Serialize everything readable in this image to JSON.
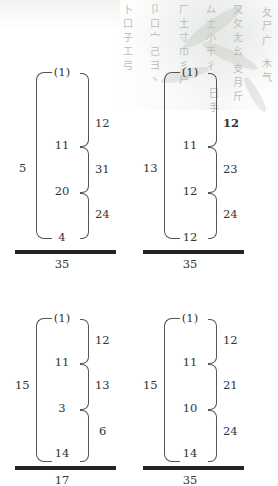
{
  "background": {
    "radical_columns": [
      [
        "卜",
        "口",
        "子",
        "工",
        "弓"
      ],
      [
        "卩",
        "口",
        "宀",
        "己",
        "彐",
        "丶"
      ],
      [
        "厂",
        "土",
        "寸",
        "巾",
        "彡",
        "户"
      ],
      [
        "厶",
        "士",
        "小",
        "干",
        "彳"
      ],
      [
        "又",
        "攵",
        "尢",
        "幺",
        "",
        "支",
        "月",
        "斤"
      ],
      [
        "",
        "夂",
        "尸",
        "广",
        "",
        "",
        "",
        "木",
        "气"
      ]
    ],
    "extra_glyphs": [
      "巳",
      "手"
    ]
  },
  "problems": [
    {
      "top": "(1)",
      "rows": [
        "11",
        "20",
        "4"
      ],
      "diffs": [
        "12",
        "31",
        "24"
      ],
      "count": "5",
      "total": "35"
    },
    {
      "top": "(1)",
      "rows": [
        "11",
        "12",
        "12"
      ],
      "diffs": [
        "12",
        "23",
        "24"
      ],
      "count": "13",
      "total": "35"
    },
    {
      "top": "(1)",
      "rows": [
        "11",
        "3",
        "14"
      ],
      "diffs": [
        "12",
        "13",
        "6"
      ],
      "count": "15",
      "total": "17"
    },
    {
      "top": "(1)",
      "rows": [
        "11",
        "10",
        "14"
      ],
      "diffs": [
        "12",
        "21",
        "24"
      ],
      "count": "15",
      "total": "35"
    }
  ]
}
